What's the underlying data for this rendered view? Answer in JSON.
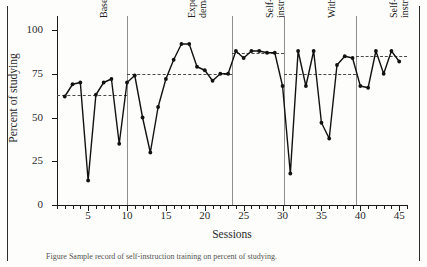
{
  "axes": {
    "ylabel": "Percent of studying",
    "xlabel": "Sessions",
    "yticks": [
      0,
      25,
      50,
      75,
      100
    ],
    "xticks_labeled": [
      5,
      10,
      15,
      20,
      25,
      30,
      35,
      40,
      45
    ]
  },
  "phases": [
    {
      "name": "Baseline",
      "label_lines": "Baseline",
      "start": 1,
      "end": 10,
      "mean": 63
    },
    {
      "name": "Experimental demands",
      "label_lines": "Experimental\ndemands",
      "start": 10,
      "end": 23.5,
      "mean": 75
    },
    {
      "name": "Self-instructions",
      "label_lines": "Self-\ninstructions",
      "start": 23.5,
      "end": 30.2,
      "mean": 87
    },
    {
      "name": "Withdrawal",
      "label_lines": "Withdrawal",
      "start": 30.2,
      "end": 39.5,
      "mean": 75
    },
    {
      "name": "Self-instructions",
      "label_lines": "Self-\ninstructions",
      "start": 39.5,
      "end": 46,
      "mean": 85
    }
  ],
  "caption": "Figure  Sample record of self-instruction training on percent of studying.",
  "chart_data": {
    "type": "line",
    "title": "",
    "xlabel": "Sessions",
    "ylabel": "Percent of studying",
    "xlim": [
      1,
      46
    ],
    "ylim": [
      0,
      108
    ],
    "grid": false,
    "legend": "none",
    "series": [
      {
        "name": "Percent of studying",
        "x": [
          2,
          3,
          4,
          5,
          6,
          7,
          8,
          9,
          10,
          11,
          12,
          13,
          14,
          15,
          16,
          17,
          18,
          19,
          20,
          21,
          22,
          23,
          24,
          25,
          26,
          27,
          28,
          29,
          30,
          31,
          32,
          33,
          34,
          35,
          36,
          37,
          38,
          39,
          40,
          41,
          42,
          43,
          44,
          45
        ],
        "y": [
          62,
          69,
          70,
          14,
          63,
          70,
          72,
          35,
          70,
          74,
          50,
          30,
          56,
          72,
          83,
          92,
          92,
          79,
          77,
          71,
          75,
          75,
          88,
          84,
          88,
          88,
          87,
          87,
          68,
          18,
          88,
          68,
          88,
          47,
          38,
          80,
          85,
          84,
          68,
          67,
          88,
          75,
          88,
          82
        ]
      }
    ],
    "phase_means": [
      {
        "phase": "Baseline",
        "value": 63
      },
      {
        "phase": "Experimental demands",
        "value": 75
      },
      {
        "phase": "Self-instructions",
        "value": 87
      },
      {
        "phase": "Withdrawal",
        "value": 75
      },
      {
        "phase": "Self-instructions",
        "value": 85
      }
    ],
    "annotations": [
      "Baseline",
      "Experimental demands",
      "Self-instructions",
      "Withdrawal",
      "Self-instructions"
    ]
  }
}
